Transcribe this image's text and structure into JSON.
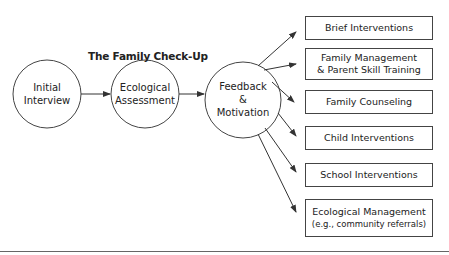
{
  "diagram": {
    "title": "The Family Check-Up",
    "stages": [
      {
        "line1": "Initial",
        "line2": "Interview"
      },
      {
        "line1": "Ecological",
        "line2": "Assessment"
      },
      {
        "line1": "Feedback",
        "line2": "&",
        "line3": "Motivation"
      }
    ],
    "outcomes": [
      {
        "line1": "Brief Interventions"
      },
      {
        "line1": "Family Management",
        "line2": "& Parent Skill Training"
      },
      {
        "line1": "Family Counseling"
      },
      {
        "line1": "Child Interventions"
      },
      {
        "line1": "School Interventions"
      },
      {
        "line1": "Ecological Management",
        "line2": "(e.g., community referrals)"
      }
    ],
    "colors": {
      "stroke": "#444444",
      "text": "#222222",
      "background": "#ffffff"
    }
  }
}
